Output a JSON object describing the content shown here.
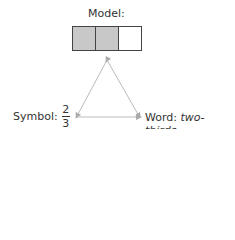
{
  "model": {
    "label": "Model:",
    "cells": [
      {
        "shaded": true
      },
      {
        "shaded": true
      },
      {
        "shaded": false
      }
    ],
    "shade_color": "#c8c8c8"
  },
  "symbol": {
    "label": "Symbol:",
    "numerator": "2",
    "denominator": "3"
  },
  "word": {
    "label": "Word:",
    "value": "two-thirds"
  },
  "connector_color": "#bbbbbb"
}
